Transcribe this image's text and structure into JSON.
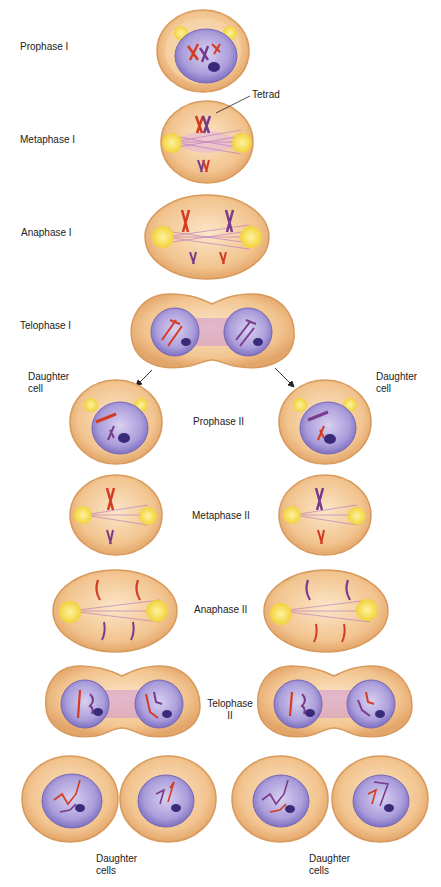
{
  "colors": {
    "cytoplasm": "#f2c48f",
    "cell_edge": "#d89a5c",
    "cell_inner": "#f7d9b0",
    "nucleus": "#a99bd6",
    "nucleus_edge": "#7767b8",
    "spindle": "#b46ac0",
    "centrosome": "#f4dd4a",
    "chrom_red": "#d53a22",
    "chrom_purple": "#7a3b8c",
    "nucleolus": "#3a2b7a"
  },
  "labels": {
    "prophase1": "Prophase I",
    "tetrad": "Tetrad",
    "metaphase1": "Metaphase I",
    "anaphase1": "Anaphase I",
    "telophase1": "Telophase I",
    "daughter_left": [
      "Daughter",
      "cell"
    ],
    "daughter_right": [
      "Daughter",
      "cell"
    ],
    "prophase2": "Prophase II",
    "metaphase2": "Metaphase II",
    "anaphase2": "Anaphase II",
    "telophase2": [
      "Telophase",
      "II"
    ],
    "daughter_cells_left": [
      "Daughter",
      "cells"
    ],
    "daughter_cells_right": [
      "Daughter",
      "cells"
    ]
  }
}
